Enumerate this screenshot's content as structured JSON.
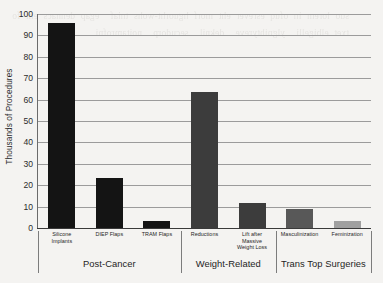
{
  "chart_data": {
    "type": "bar",
    "title": "",
    "xlabel": "",
    "ylabel": "Thousands of Procedures",
    "ylim": [
      0,
      100
    ],
    "yticks": [
      0,
      10,
      20,
      30,
      40,
      50,
      60,
      70,
      80,
      90,
      100
    ],
    "grid": true,
    "legend": "none",
    "categories": [
      "Silicone Implants",
      "DIEP Flaps",
      "TRAM Flaps",
      "Reductions",
      "Lift after Massive Weight Loss",
      "Masculinization",
      "Feminization"
    ],
    "values": [
      96,
      23.5,
      3.5,
      63.5,
      11.5,
      8.8,
      3.5
    ],
    "bar_colors": [
      "#141414",
      "#141414",
      "#141414",
      "#3c3c3c",
      "#3c3c3c",
      "#585858",
      "#a0a0a0"
    ],
    "groups": [
      {
        "label": "Post-Cancer",
        "categories": [
          "Silicone Implants",
          "DIEP Flaps",
          "TRAM Flaps"
        ]
      },
      {
        "label": "Weight-Related",
        "categories": [
          "Reductions",
          "Lift after Massive Weight Loss"
        ]
      },
      {
        "label": "Trans Top Surgeries",
        "categories": [
          "Masculinization",
          "Feminization"
        ]
      }
    ]
  },
  "axis": {
    "y_title": "Thousands of Procedures",
    "tick_labels": [
      "0",
      "10",
      "20",
      "30",
      "40",
      "50",
      "60",
      "70",
      "80",
      "90",
      "100"
    ]
  },
  "category_labels": [
    {
      "lines": [
        "Silicone",
        "Implants"
      ]
    },
    {
      "lines": [
        "DIEP Flaps"
      ]
    },
    {
      "lines": [
        "TRAM Flaps"
      ]
    },
    {
      "lines": [
        "Reductions"
      ]
    },
    {
      "lines": [
        "Lift after",
        "Massive",
        "Weight Loss"
      ]
    },
    {
      "lines": [
        "Masculinization"
      ]
    },
    {
      "lines": [
        "Feminization"
      ]
    }
  ],
  "group_labels": [
    "Post-Cancer",
    "Weight-Related",
    "Trans Top Surgeries"
  ],
  "background_bleed": "suo lorem in ofuq esrever eht morf hguorht-wohs tniaf  egap dennacs eht fo  txet elbigelli  ylgnihtyreve  deknil  secudorp  noitamrofni"
}
